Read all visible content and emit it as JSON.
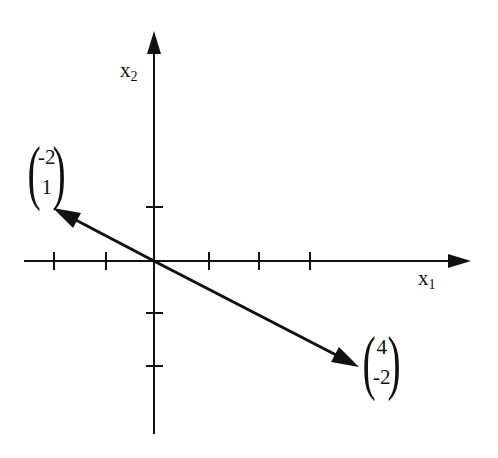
{
  "diagram": {
    "title": "",
    "axes": {
      "x_label": "x",
      "x_sub": "1",
      "y_label": "x",
      "y_sub": "2",
      "origin_px": [
        154,
        261
      ],
      "unit_px": 52,
      "x_ticks": [
        -2,
        -1,
        1,
        2,
        3
      ],
      "y_ticks": [
        1,
        -1,
        -2
      ]
    },
    "vectors": [
      {
        "name": "v1",
        "components": [
          "-2",
          "1"
        ],
        "from": [
          0,
          0
        ],
        "to": [
          -2,
          1
        ]
      },
      {
        "name": "v2",
        "components": [
          "4",
          "-2"
        ],
        "from": [
          0,
          0
        ],
        "to": [
          4,
          -2
        ]
      }
    ],
    "colors": {
      "stroke": "#111111",
      "background": "#ffffff"
    }
  }
}
